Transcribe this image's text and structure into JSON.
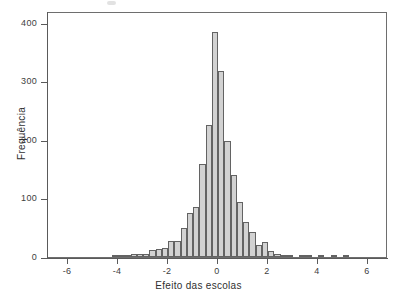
{
  "chart_data": {
    "type": "bar",
    "title": "",
    "subtitle": "",
    "xlabel": "Efeito das escolas",
    "ylabel": "Frequência",
    "xlim": [
      -6.8,
      6.8
    ],
    "ylim": [
      0,
      420
    ],
    "xticks": [
      -6,
      -4,
      -2,
      0,
      2,
      4,
      6
    ],
    "xtick_labels": [
      "-6",
      "-4",
      "-2",
      "0",
      "2",
      "4",
      "6"
    ],
    "yticks": [
      0,
      100,
      200,
      300,
      400
    ],
    "ytick_labels": [
      "0",
      "100",
      "200",
      "300",
      "400"
    ],
    "grid": false,
    "legend": null,
    "bin_width": 0.25,
    "bar_fill_color": "#d2d2d2",
    "bar_edge_color": "#636363",
    "axis_color": "#5a5a5a",
    "background_color": "#ffffff",
    "bins": [
      {
        "center": -4.125,
        "left": -4.25,
        "right": -4.0,
        "value": 2
      },
      {
        "center": -3.875,
        "left": -4.0,
        "right": -3.75,
        "value": 2
      },
      {
        "center": -3.625,
        "left": -3.75,
        "right": -3.5,
        "value": 3
      },
      {
        "center": -3.375,
        "left": -3.5,
        "right": -3.25,
        "value": 6
      },
      {
        "center": -3.125,
        "left": -3.25,
        "right": -3.0,
        "value": 5
      },
      {
        "center": -2.875,
        "left": -3.0,
        "right": -2.75,
        "value": 5
      },
      {
        "center": -2.625,
        "left": -2.75,
        "right": -2.5,
        "value": 12
      },
      {
        "center": -2.375,
        "left": -2.5,
        "right": -2.25,
        "value": 13
      },
      {
        "center": -2.125,
        "left": -2.25,
        "right": -2.0,
        "value": 16
      },
      {
        "center": -1.875,
        "left": -2.0,
        "right": -1.75,
        "value": 28
      },
      {
        "center": -1.625,
        "left": -1.75,
        "right": -1.5,
        "value": 27
      },
      {
        "center": -1.375,
        "left": -1.5,
        "right": -1.25,
        "value": 50
      },
      {
        "center": -1.125,
        "left": -1.25,
        "right": -1.0,
        "value": 76
      },
      {
        "center": -0.875,
        "left": -1.0,
        "right": -0.75,
        "value": 85
      },
      {
        "center": -0.625,
        "left": -0.75,
        "right": -0.5,
        "value": 159
      },
      {
        "center": -0.375,
        "left": -0.5,
        "right": -0.25,
        "value": 226
      },
      {
        "center": -0.125,
        "left": -0.25,
        "right": 0.0,
        "value": 385
      },
      {
        "center": 0.125,
        "left": 0.0,
        "right": 0.25,
        "value": 318
      },
      {
        "center": 0.375,
        "left": 0.25,
        "right": 0.5,
        "value": 198
      },
      {
        "center": 0.625,
        "left": 0.5,
        "right": 0.75,
        "value": 140
      },
      {
        "center": 0.875,
        "left": 0.75,
        "right": 1.0,
        "value": 94
      },
      {
        "center": 1.125,
        "left": 1.0,
        "right": 1.25,
        "value": 59
      },
      {
        "center": 1.375,
        "left": 1.25,
        "right": 1.5,
        "value": 43
      },
      {
        "center": 1.625,
        "left": 1.5,
        "right": 1.75,
        "value": 21
      },
      {
        "center": 1.875,
        "left": 1.75,
        "right": 2.0,
        "value": 26
      },
      {
        "center": 2.125,
        "left": 2.0,
        "right": 2.25,
        "value": 11
      },
      {
        "center": 2.375,
        "left": 2.25,
        "right": 2.5,
        "value": 5
      },
      {
        "center": 2.625,
        "left": 2.5,
        "right": 2.75,
        "value": 3
      },
      {
        "center": 2.875,
        "left": 2.75,
        "right": 3.0,
        "value": 3
      },
      {
        "center": 3.375,
        "left": 3.25,
        "right": 3.5,
        "value": 4
      },
      {
        "center": 3.625,
        "left": 3.5,
        "right": 3.75,
        "value": 4
      },
      {
        "center": 4.125,
        "left": 4.0,
        "right": 4.25,
        "value": 3
      },
      {
        "center": 4.625,
        "left": 4.5,
        "right": 4.75,
        "value": 3
      },
      {
        "center": 5.125,
        "left": 5.0,
        "right": 5.25,
        "value": 2
      }
    ]
  }
}
